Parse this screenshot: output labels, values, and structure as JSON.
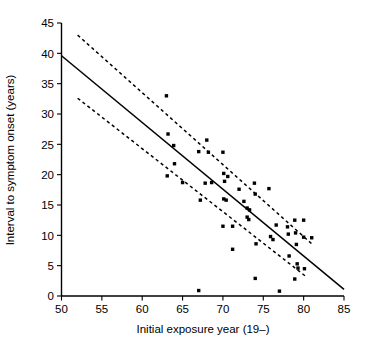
{
  "chart_data": {
    "type": "scatter",
    "title": "",
    "subtitle": "",
    "xlabel": "Initial exposure year (19–)",
    "ylabel": "Interval to symptom onset (years)",
    "xlim": [
      50,
      85
    ],
    "ylim": [
      0,
      45
    ],
    "xticks": [
      50,
      55,
      60,
      65,
      70,
      75,
      80,
      85
    ],
    "yticks": [
      0,
      5,
      10,
      15,
      20,
      25,
      30,
      35,
      40,
      45
    ],
    "xtick_labels": [
      "50",
      "55",
      "60",
      "65",
      "70",
      "75",
      "80",
      "85"
    ],
    "ytick_labels": [
      "0",
      "5",
      "10",
      "15",
      "20",
      "25",
      "30",
      "35",
      "40",
      "45"
    ],
    "grid": false,
    "legend": null,
    "legend_position": "none",
    "marker": "filled-square",
    "marker_color": "#000000",
    "points": [
      {
        "x": 63.0,
        "y": 33.0
      },
      {
        "x": 63.2,
        "y": 26.7
      },
      {
        "x": 63.9,
        "y": 24.8
      },
      {
        "x": 64.0,
        "y": 21.8
      },
      {
        "x": 63.1,
        "y": 19.8
      },
      {
        "x": 65.0,
        "y": 18.7
      },
      {
        "x": 67.0,
        "y": 23.8
      },
      {
        "x": 68.0,
        "y": 25.7
      },
      {
        "x": 68.2,
        "y": 23.7
      },
      {
        "x": 67.2,
        "y": 15.8
      },
      {
        "x": 67.8,
        "y": 18.6
      },
      {
        "x": 68.6,
        "y": 18.7
      },
      {
        "x": 70.0,
        "y": 23.7
      },
      {
        "x": 70.1,
        "y": 20.2
      },
      {
        "x": 70.6,
        "y": 19.7
      },
      {
        "x": 70.2,
        "y": 18.9
      },
      {
        "x": 70.1,
        "y": 16.0
      },
      {
        "x": 70.4,
        "y": 15.8
      },
      {
        "x": 70.0,
        "y": 11.5
      },
      {
        "x": 71.2,
        "y": 11.5
      },
      {
        "x": 71.2,
        "y": 7.7
      },
      {
        "x": 72.0,
        "y": 17.6
      },
      {
        "x": 72.6,
        "y": 15.6
      },
      {
        "x": 73.0,
        "y": 14.5
      },
      {
        "x": 73.3,
        "y": 14.2
      },
      {
        "x": 73.0,
        "y": 13.0
      },
      {
        "x": 73.2,
        "y": 12.6
      },
      {
        "x": 73.9,
        "y": 18.6
      },
      {
        "x": 74.0,
        "y": 16.8
      },
      {
        "x": 74.1,
        "y": 8.6
      },
      {
        "x": 74.0,
        "y": 2.9
      },
      {
        "x": 75.7,
        "y": 17.7
      },
      {
        "x": 75.9,
        "y": 9.8
      },
      {
        "x": 76.2,
        "y": 9.3
      },
      {
        "x": 76.6,
        "y": 11.7
      },
      {
        "x": 78.0,
        "y": 11.4
      },
      {
        "x": 78.1,
        "y": 10.2
      },
      {
        "x": 78.2,
        "y": 6.6
      },
      {
        "x": 78.9,
        "y": 12.5
      },
      {
        "x": 79.0,
        "y": 10.4
      },
      {
        "x": 79.1,
        "y": 8.5
      },
      {
        "x": 79.2,
        "y": 5.3
      },
      {
        "x": 79.3,
        "y": 4.6
      },
      {
        "x": 78.9,
        "y": 2.8
      },
      {
        "x": 80.0,
        "y": 12.5
      },
      {
        "x": 80.0,
        "y": 9.7
      },
      {
        "x": 80.1,
        "y": 4.5
      },
      {
        "x": 81.0,
        "y": 9.6
      },
      {
        "x": 67.0,
        "y": 0.9
      },
      {
        "x": 77.0,
        "y": 0.8
      }
    ],
    "fit_line": {
      "name": "regression line",
      "style": "solid",
      "x": [
        50,
        85
      ],
      "y": [
        39.6,
        1.1
      ]
    },
    "confidence_bands": [
      {
        "name": "upper confidence limit",
        "style": "dashed",
        "x": [
          52,
          81
        ],
        "y": [
          43.0,
          8.6
        ]
      },
      {
        "name": "lower confidence limit",
        "style": "dashed",
        "x": [
          52,
          80.3
        ],
        "y": [
          32.6,
          3.2
        ]
      }
    ]
  },
  "axes": {
    "x_axis_title": "Initial exposure year (19–)",
    "y_axis_title": "Interval to symptom onset (years)"
  }
}
